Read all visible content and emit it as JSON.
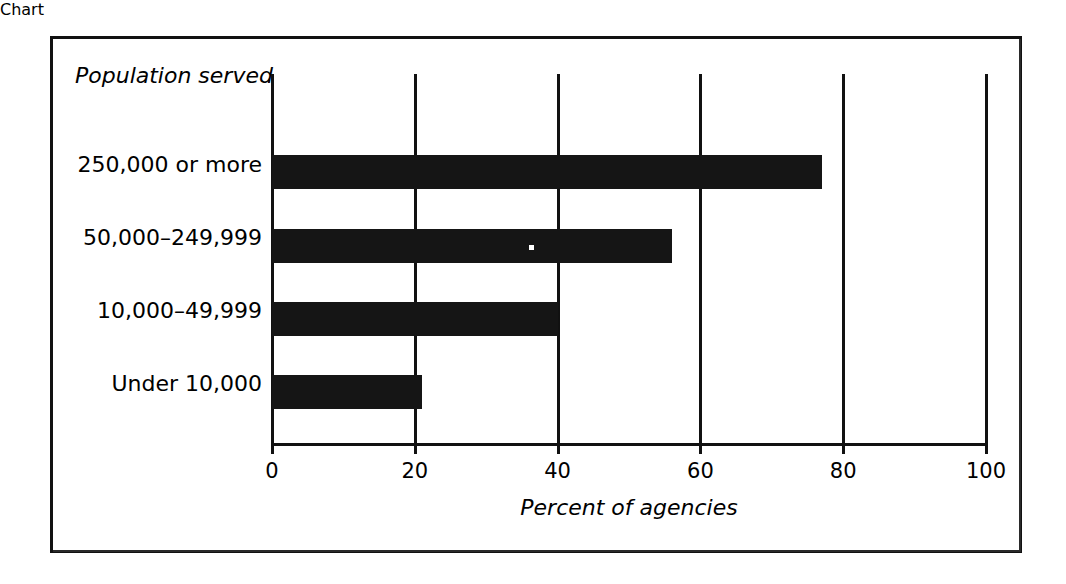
{
  "figure": {
    "background_color": "#ffffff",
    "border_color": "#111111",
    "bar_color": "#151515"
  },
  "chart_data": {
    "type": "bar",
    "orientation": "horizontal",
    "title": "",
    "subtitle": "",
    "xlabel": "Percent of agencies",
    "ylabel": "Population served",
    "categories": [
      "250,000 or more",
      "50,000–249,999",
      "10,000–49,999",
      "Under 10,000"
    ],
    "values": [
      77,
      56,
      40,
      21
    ],
    "xlim": [
      0,
      100
    ],
    "xticks": [
      0,
      20,
      40,
      60,
      80,
      100
    ],
    "xtick_labels": [
      "0",
      "20",
      "40",
      "60",
      "80",
      "100"
    ],
    "grid": true,
    "grid_axis": "x",
    "legend": false,
    "legend_position": "none"
  }
}
